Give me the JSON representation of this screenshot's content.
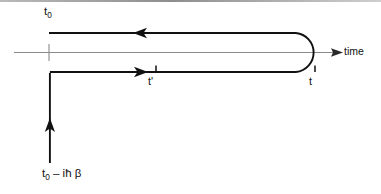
{
  "figure": {
    "type": "keldysh-contour-diagram",
    "title": "",
    "background_color": "#ffffff",
    "stroke_color": "#111111",
    "axis_color": "#8a8a8a",
    "width": 381,
    "height": 194,
    "top_rule": {
      "name": "top-divider-rule",
      "color": "#9a9a9a"
    },
    "axis": {
      "name": "time-axis",
      "label": "time",
      "start_x": 14,
      "end_x": 341,
      "y": 52,
      "arrow": "right",
      "tick": {
        "x": 49,
        "label": ""
      }
    },
    "labels": {
      "t0": {
        "base": "t",
        "sub": "0"
      },
      "t0_minus_ihbar_beta": {
        "base": "t",
        "sub": "0",
        "rest": " – iħ β"
      },
      "t_prime": "t'",
      "t": "t",
      "time": "time"
    },
    "contour": {
      "name": "keldysh-time-contour",
      "branches": [
        {
          "name": "upper-branch",
          "description": "backward horizontal branch at top",
          "y": 33,
          "x_start": 49,
          "x_end": 296,
          "direction": "leftward",
          "arrow_x": 143
        },
        {
          "name": "lower-branch",
          "description": "forward horizontal branch below axis",
          "y": 72,
          "x_start": 49,
          "x_end": 296,
          "direction": "rightward",
          "arrow_x": 138
        },
        {
          "name": "turning-point-arc",
          "description": "semicircular U-turn on the right joining lower and upper branches",
          "center_x": 296,
          "center_y": 52.5,
          "radius": 19.5
        },
        {
          "name": "imaginary-branch",
          "description": "vertical downward branch on the left",
          "x": 49,
          "y_start": 72,
          "y_end": 163,
          "direction": "upward-arrow",
          "arrow_y": 128
        }
      ],
      "ticks": [
        {
          "name": "t-prime-tick",
          "x": 156,
          "y": 72,
          "label": "t'"
        },
        {
          "name": "t-tick",
          "x": 315,
          "y": 72,
          "label": "t"
        }
      ]
    }
  }
}
